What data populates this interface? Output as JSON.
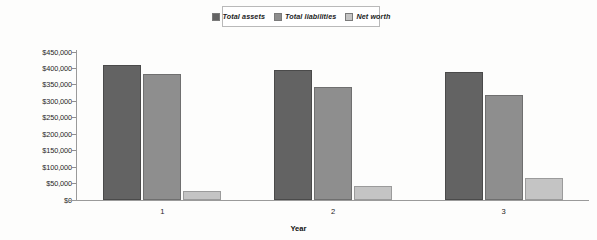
{
  "chart_data": {
    "type": "bar",
    "title": "",
    "xlabel": "Year",
    "ylabel": "",
    "categories": [
      "1",
      "2",
      "3"
    ],
    "series": [
      {
        "name": "Total assets",
        "color": "#636363",
        "values": [
          410000,
          395000,
          388000
        ]
      },
      {
        "name": "Total liabilities",
        "color": "#8e8e8e",
        "values": [
          382000,
          345000,
          320000
        ]
      },
      {
        "name": "Net worth",
        "color": "#c4c4c4",
        "values": [
          28000,
          42000,
          68000
        ]
      }
    ],
    "ylim": [
      0,
      450000
    ],
    "ytick_step": 50000,
    "ytick_labels": [
      "$450,000",
      "$400,000",
      "$350,000",
      "$300,000",
      "$250,000",
      "$200,000",
      "$150,000",
      "$100,000",
      "$50,000",
      "$0"
    ],
    "ytick_values": [
      450000,
      400000,
      350000,
      300000,
      250000,
      200000,
      150000,
      100000,
      50000,
      0
    ],
    "grid": false,
    "legend_position": "top-center"
  },
  "legend": {
    "entries": [
      {
        "label": "Total assets"
      },
      {
        "label": "Total liabilities"
      },
      {
        "label": "Net worth"
      }
    ]
  },
  "axes": {
    "x_title": "Year"
  }
}
